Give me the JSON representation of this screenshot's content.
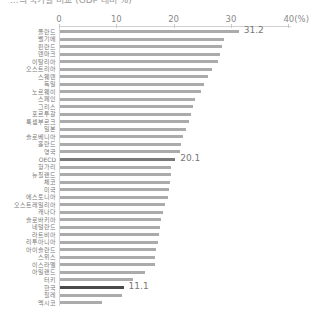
{
  "chart_data": {
    "type": "bar",
    "orientation": "horizontal",
    "title": "",
    "xlabel": "",
    "ylabel": "",
    "unit": "%",
    "xlim": [
      0,
      40
    ],
    "ticks": [
      "0",
      "10",
      "20",
      "30",
      "40(%)"
    ],
    "tick_values": [
      0,
      10,
      20,
      30,
      40
    ],
    "grid": false,
    "legend": null,
    "categories": [
      "폴란드",
      "벨기에",
      "핀란드",
      "덴마크",
      "이탈리아",
      "오스트리아",
      "스웨덴",
      "독일",
      "노르웨이",
      "스페인",
      "그리스",
      "포르투갈",
      "룩셈부르크",
      "일본",
      "슬로베니아",
      "홀란드",
      "영국",
      "OECD",
      "헝가리",
      "뉴질랜드",
      "체코",
      "미국",
      "에스토니아",
      "오스트레일리아",
      "캐나다",
      "슬로바키아",
      "네덜란드",
      "라트비아",
      "리투아니아",
      "아이슬란드",
      "스위스",
      "이스라엘",
      "아일랜드",
      "터키",
      "한국",
      "칠레",
      "멕시코"
    ],
    "values": [
      31.2,
      28.7,
      28.3,
      28.0,
      27.6,
      26.6,
      25.9,
      25.2,
      24.6,
      23.6,
      23.2,
      22.9,
      22.5,
      22.0,
      21.5,
      21.1,
      20.9,
      20.1,
      19.3,
      19.4,
      19.2,
      19.1,
      18.8,
      18.4,
      18.0,
      17.6,
      17.5,
      17.2,
      17.1,
      16.7,
      16.6,
      16.5,
      14.9,
      12.8,
      11.1,
      10.8,
      7.4
    ],
    "labeled_values": {
      "폴란드": "31.2",
      "OECD": "20.1",
      "한국": "11.1"
    },
    "highlight": {
      "OECD": "#7a7a7a",
      "한국": "#4a4a4a"
    },
    "bar_color": "#ababab"
  },
  "title": "...의 국가별 비교 (GDP 대비 %)"
}
